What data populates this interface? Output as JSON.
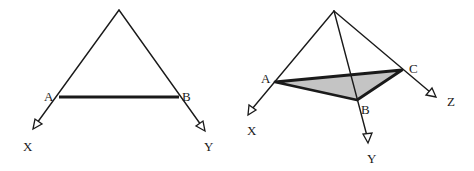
{
  "figures": [
    {
      "id": "left",
      "description": "Two lines from a common apex with segment AB joining them",
      "apex": [
        119,
        10
      ],
      "points": {
        "A": {
          "label": "A",
          "xy": [
            59,
            97
          ]
        },
        "B": {
          "label": "B",
          "xy": [
            179,
            97
          ]
        }
      },
      "rays": {
        "X": {
          "label": "X",
          "tip": [
            33,
            129
          ]
        },
        "Y": {
          "label": "Y",
          "tip": [
            205,
            131
          ]
        }
      }
    },
    {
      "id": "right",
      "description": "Three rays from a common apex with shaded triangle ABC",
      "apex": [
        334,
        11
      ],
      "points": {
        "A": {
          "label": "A",
          "xy": [
            275,
            82
          ]
        },
        "B": {
          "label": "B",
          "xy": [
            357,
            100
          ]
        },
        "C": {
          "label": "C",
          "xy": [
            402,
            70
          ]
        }
      },
      "rays": {
        "X": {
          "label": "X",
          "tip": [
            248,
            115
          ]
        },
        "Y": {
          "label": "Y",
          "tip": [
            368,
            143
          ]
        },
        "Z": {
          "label": "Z",
          "tip": [
            436,
            97
          ]
        }
      },
      "triangle_fill": "#c4c4c4"
    }
  ],
  "colors": {
    "line": "#1a1a1a",
    "fill": "#c4c4c4",
    "background": "#ffffff"
  },
  "labels": {
    "left": {
      "A": "A",
      "B": "B",
      "X": "X",
      "Y": "Y"
    },
    "right": {
      "A": "A",
      "B": "B",
      "C": "C",
      "X": "X",
      "Y": "Y",
      "Z": "Z"
    }
  }
}
